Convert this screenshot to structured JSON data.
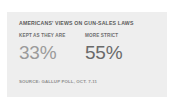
{
  "card": {
    "background_color": "#eeeeee",
    "page_background_color": "#ffffff"
  },
  "chart_data": {
    "type": "bar",
    "title": "AMERICANS' VIEWS ON GUN-SALES LAWS",
    "subtitle": "",
    "xlabel": "",
    "ylabel": "",
    "categories": [
      "KEPT AS THEY ARE",
      "MORE STRICT"
    ],
    "values": [
      33,
      55
    ],
    "value_labels": [
      "33%",
      "55%"
    ],
    "units": "percent",
    "ylim": [
      0,
      100
    ],
    "grid": false,
    "legend": false,
    "source": "SOURCE: GALLUP POLL, OCT. 7-11",
    "series_colors": [
      "#9b9b9b",
      "#6a6a6a"
    ]
  }
}
